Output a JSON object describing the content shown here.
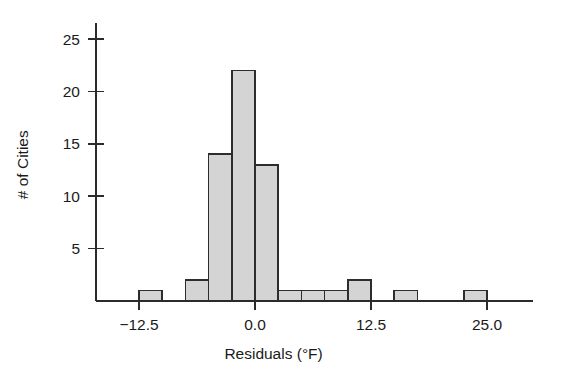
{
  "chart_data": {
    "type": "bar",
    "title": "",
    "subtitle": "",
    "xlabel": "Residuals (°F)",
    "ylabel": "# of Cities",
    "grid": false,
    "legend": false,
    "legend_position": "none",
    "bin_width": 2.5,
    "xlim": [
      -15.0,
      30.0
    ],
    "ylim": [
      0,
      26.5
    ],
    "xticks": [
      -12.5,
      0.0,
      12.5,
      25.0
    ],
    "xtick_labels": [
      "−12.5",
      "0.0",
      "12.5",
      "25.0"
    ],
    "yticks": [
      5,
      10,
      15,
      20,
      25
    ],
    "ytick_labels": [
      "5",
      "10",
      "15",
      "20",
      "25"
    ],
    "bin_starts": [
      -12.5,
      -10.0,
      -7.5,
      -5.0,
      -2.5,
      0.0,
      2.5,
      5.0,
      7.5,
      10.0,
      12.5,
      15.0,
      17.5,
      20.0,
      22.5
    ],
    "values": [
      1,
      0,
      2,
      14,
      22,
      13,
      1,
      1,
      1,
      2,
      0,
      1,
      0,
      0,
      1
    ],
    "total_count": 59
  },
  "figure": {
    "background_color": "#ffffff",
    "bar_fill_color": "#d4d4d4",
    "bar_edge_color": "#2d2d2d",
    "axis_color": "#2b2b2b",
    "text_color": "#1a1a1a"
  }
}
